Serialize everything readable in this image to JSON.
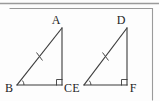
{
  "figure": {
    "background_color": "#fdfdfd",
    "stroke_color": "#3b3b3b",
    "frame_color": "#9a9a9a",
    "label_color": "#242424"
  },
  "triangles": [
    {
      "name": "triangle-abc",
      "vertices": {
        "apex": {
          "label": "A",
          "x": 62,
          "y": 28,
          "label_x": 56,
          "label_y": 24
        },
        "left": {
          "label": "B",
          "x": 17,
          "y": 85,
          "label_x": 6,
          "label_y": 92
        },
        "right": {
          "label": "C",
          "x": 62,
          "y": 85,
          "label_x": 65,
          "label_y": 92
        }
      },
      "marks": {
        "hypotenuse_tick": {
          "name": "tick-mark-ab",
          "cx": 39.5,
          "cy": 56.5
        },
        "angle_arc": {
          "name": "angle-arc-b",
          "vertex_x": 17,
          "vertex_y": 85,
          "radius": 7
        },
        "right_angle": {
          "name": "right-angle-c",
          "x": 62,
          "y": 85,
          "size": 6
        }
      }
    },
    {
      "name": "triangle-def",
      "vertices": {
        "apex": {
          "label": "D",
          "x": 127,
          "y": 28,
          "label_x": 121,
          "label_y": 24
        },
        "left": {
          "label": "E",
          "x": 84,
          "y": 85,
          "label_x": 73,
          "label_y": 92
        },
        "right": {
          "label": "F",
          "x": 127,
          "y": 85,
          "label_x": 130,
          "label_y": 92
        }
      },
      "marks": {
        "hypotenuse_tick": {
          "name": "tick-mark-de",
          "cx": 105.5,
          "cy": 56.5
        },
        "angle_arc": {
          "name": "angle-arc-e",
          "vertex_x": 84,
          "vertex_y": 85,
          "radius": 7
        },
        "right_angle": {
          "name": "right-angle-f",
          "x": 127,
          "y": 85,
          "size": 6
        }
      }
    }
  ],
  "labels": {
    "a": "A",
    "b": "B",
    "c": "C",
    "d": "D",
    "e": "E",
    "f": "F"
  }
}
